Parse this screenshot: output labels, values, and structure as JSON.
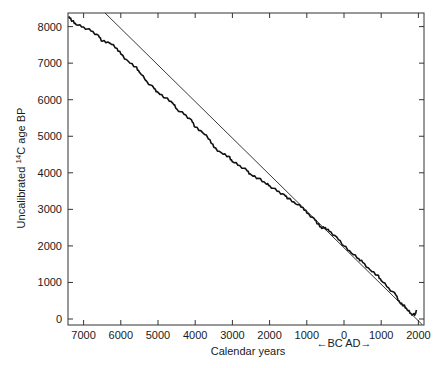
{
  "chart_data": {
    "type": "line",
    "title": "",
    "xlabel": "Calendar years",
    "xlabel_sub": "←BC  AD→",
    "ylabel_prefix": "Uncalibrated ",
    "ylabel_sup": "14",
    "ylabel_suffix": "C age BP",
    "x_ticks": [
      {
        "value": -7000,
        "label": "7000"
      },
      {
        "value": -6000,
        "label": "6000"
      },
      {
        "value": -5000,
        "label": "5000"
      },
      {
        "value": -4000,
        "label": "4000"
      },
      {
        "value": -3000,
        "label": "3000"
      },
      {
        "value": -2000,
        "label": "2000"
      },
      {
        "value": -1000,
        "label": "1000"
      },
      {
        "value": 0,
        "label": "0"
      },
      {
        "value": 1000,
        "label": "1000"
      },
      {
        "value": 2000,
        "label": "2000"
      }
    ],
    "y_ticks": [
      {
        "value": 0,
        "label": "0"
      },
      {
        "value": 1000,
        "label": "1000"
      },
      {
        "value": 2000,
        "label": "2000"
      },
      {
        "value": 3000,
        "label": "3000"
      },
      {
        "value": 4000,
        "label": "4000"
      },
      {
        "value": 5000,
        "label": "5000"
      },
      {
        "value": 6000,
        "label": "6000"
      },
      {
        "value": 7000,
        "label": "7000"
      },
      {
        "value": 8000,
        "label": "8000"
      }
    ],
    "xlim": [
      -7450,
      2150
    ],
    "ylim": [
      -150,
      8400
    ],
    "grid": false,
    "legend": null,
    "series": [
      {
        "name": "Radiocarbon calibration curve",
        "style": "thick-wiggly",
        "x": [
          -7400,
          -7300,
          -7200,
          -7000,
          -6800,
          -6600,
          -6500,
          -6300,
          -6100,
          -6000,
          -5800,
          -5600,
          -5500,
          -5300,
          -5100,
          -5000,
          -4800,
          -4600,
          -4500,
          -4300,
          -4100,
          -4000,
          -3800,
          -3600,
          -3500,
          -3300,
          -3100,
          -3000,
          -2800,
          -2600,
          -2500,
          -2300,
          -2100,
          -2000,
          -1800,
          -1600,
          -1500,
          -1300,
          -1100,
          -1000,
          -800,
          -700,
          -600,
          -500,
          -400,
          -200,
          0,
          200,
          400,
          500,
          700,
          900,
          1000,
          1200,
          1400,
          1500,
          1600,
          1700,
          1800,
          1900,
          1950
        ],
        "values": [
          8280,
          8150,
          8050,
          7990,
          7880,
          7760,
          7600,
          7550,
          7400,
          7250,
          7050,
          6900,
          6750,
          6500,
          6300,
          6200,
          6050,
          5900,
          5750,
          5600,
          5450,
          5250,
          5100,
          4900,
          4700,
          4550,
          4450,
          4300,
          4200,
          4050,
          3950,
          3850,
          3700,
          3650,
          3500,
          3400,
          3300,
          3150,
          3050,
          2900,
          2750,
          2600,
          2480,
          2500,
          2400,
          2250,
          2000,
          1800,
          1650,
          1550,
          1350,
          1200,
          1050,
          850,
          650,
          450,
          380,
          250,
          150,
          100,
          250
        ]
      },
      {
        "name": "1:1 line (calendar = radiocarbon)",
        "style": "thin-straight",
        "x": [
          -6500,
          2100
        ],
        "values": [
          8450,
          -150
        ]
      }
    ]
  }
}
